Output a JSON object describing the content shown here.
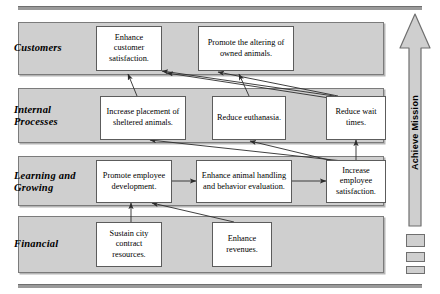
{
  "diagram": {
    "type": "balanced-scorecard-strategy-map",
    "bands": [
      {
        "id": "customers",
        "label": "Customers"
      },
      {
        "id": "internal-processes",
        "label": "Internal\nProcesses"
      },
      {
        "id": "learning-growing",
        "label": "Learning and\nGrowing"
      },
      {
        "id": "financial",
        "label": "Financial"
      }
    ],
    "objectives": [
      {
        "id": "enhance-customer-satisfaction",
        "band": "customers",
        "text": "Enhance customer satisfaction."
      },
      {
        "id": "promote-altering-owned-animals",
        "band": "customers",
        "text": "Promote the altering of owned animals."
      },
      {
        "id": "increase-placement-sheltered-animals",
        "band": "internal-processes",
        "text": "Increase placement of sheltered animals."
      },
      {
        "id": "reduce-euthanasia",
        "band": "internal-processes",
        "text": "Reduce euthanasia."
      },
      {
        "id": "reduce-wait-times",
        "band": "internal-processes",
        "text": "Reduce wait times."
      },
      {
        "id": "promote-employee-development",
        "band": "learning-growing",
        "text": "Promote employee development."
      },
      {
        "id": "enhance-animal-handling",
        "band": "learning-growing",
        "text": "Enhance animal handling and behavior evaluation."
      },
      {
        "id": "increase-employee-satisfaction",
        "band": "learning-growing",
        "text": "Increase employee satisfaction."
      },
      {
        "id": "sustain-city-contract-resources",
        "band": "financial",
        "text": "Sustain city contract resources."
      },
      {
        "id": "enhance-revenues",
        "band": "financial",
        "text": "Enhance revenues."
      }
    ],
    "links": [
      {
        "from": "increase-placement-sheltered-animals",
        "to": "enhance-customer-satisfaction"
      },
      {
        "from": "reduce-euthanasia",
        "to": "promote-altering-owned-animals"
      },
      {
        "from": "reduce-wait-times",
        "to": "enhance-customer-satisfaction"
      },
      {
        "from": "reduce-wait-times",
        "to": "promote-altering-owned-animals"
      },
      {
        "from": "increase-employee-satisfaction",
        "to": "increase-placement-sheltered-animals"
      },
      {
        "from": "increase-employee-satisfaction",
        "to": "reduce-euthanasia"
      },
      {
        "from": "increase-employee-satisfaction",
        "to": "reduce-wait-times"
      },
      {
        "from": "promote-employee-development",
        "to": "enhance-animal-handling"
      },
      {
        "from": "enhance-animal-handling",
        "to": "increase-employee-satisfaction"
      },
      {
        "from": "sustain-city-contract-resources",
        "to": "promote-employee-development"
      },
      {
        "from": "enhance-revenues",
        "to": "promote-employee-development"
      }
    ],
    "mission": {
      "label": "Achieve Mission",
      "direction": "up"
    },
    "colors": {
      "band_fill": "#cfcfcf",
      "band_border": "#7b7b7b",
      "box_fill": "#ffffff",
      "box_border": "#5c5c5c",
      "rule": "#9a9a9a",
      "arrow": "#2b2b2b"
    }
  }
}
